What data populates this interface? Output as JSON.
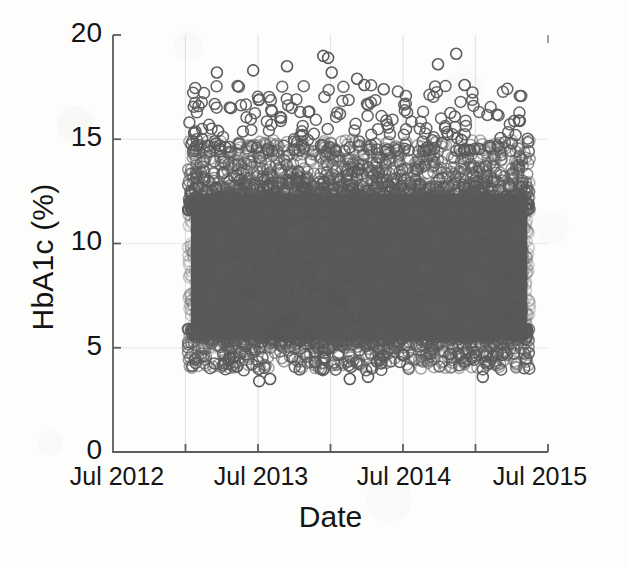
{
  "chart_data": {
    "type": "scatter",
    "title": "",
    "xlabel": "Date",
    "ylabel": "HbA1c (%)",
    "ylim": [
      0,
      20
    ],
    "yticks": [
      0,
      5,
      10,
      15,
      20
    ],
    "ytick_labels": [
      "0",
      "5",
      "10",
      "15",
      "20"
    ],
    "xlim": [
      "Jul 2012",
      "Jul 2015"
    ],
    "xtick_labels": [
      "Jul 2012",
      "Jul 2013",
      "Jul 2014",
      "Jul 2015"
    ],
    "xtick_positions_months": [
      0,
      12,
      24,
      36
    ],
    "xgrid_positions_months": [
      6,
      12,
      18,
      24,
      30
    ],
    "grid": true,
    "grid_axis": "x",
    "legend": "none",
    "marker": "open-circle",
    "marker_size_px": 11,
    "marker_color": "#5a5a5a",
    "marker_fill": "none",
    "n_points_approx": 9000,
    "data_x_range_months": [
      6.2,
      34.5
    ],
    "data_y_range": [
      3.4,
      19.1
    ],
    "dense_band_y": [
      5.0,
      13.0
    ],
    "series": [
      {
        "name": "HbA1c measurements",
        "marker": "open-circle",
        "color": "#5a5a5a",
        "outliers_high": [
          {
            "x_months": 8.6,
            "y": 18.2
          },
          {
            "x_months": 11.6,
            "y": 18.3
          },
          {
            "x_months": 12.1,
            "y": 16.9
          },
          {
            "x_months": 14.4,
            "y": 18.5
          },
          {
            "x_months": 17.4,
            "y": 19.0
          },
          {
            "x_months": 17.8,
            "y": 18.9
          },
          {
            "x_months": 18.1,
            "y": 18.2
          },
          {
            "x_months": 20.2,
            "y": 17.9
          },
          {
            "x_months": 20.8,
            "y": 17.6
          },
          {
            "x_months": 22.4,
            "y": 17.4
          },
          {
            "x_months": 26.9,
            "y": 18.6
          },
          {
            "x_months": 28.4,
            "y": 19.1
          },
          {
            "x_months": 29.1,
            "y": 17.6
          },
          {
            "x_months": 8.7,
            "y": 15.4
          },
          {
            "x_months": 15.7,
            "y": 15.2
          },
          {
            "x_months": 33.6,
            "y": 15.9
          }
        ],
        "outliers_low": [
          {
            "x_months": 12.1,
            "y": 3.4
          },
          {
            "x_months": 13.0,
            "y": 3.5
          },
          {
            "x_months": 19.6,
            "y": 3.5
          },
          {
            "x_months": 21.1,
            "y": 3.6
          },
          {
            "x_months": 30.6,
            "y": 3.6
          }
        ]
      }
    ]
  },
  "figure": {
    "background": "#fdfdfc",
    "axis_color": "#5d5d5d",
    "grid_color": "#e2e2e0",
    "text_color": "#151515"
  }
}
